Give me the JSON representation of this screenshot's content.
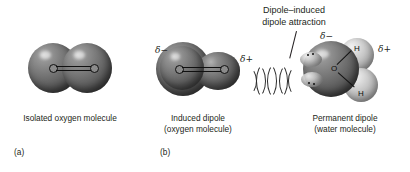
{
  "figure": {
    "background": "#ffffff",
    "callout": {
      "line1": "Dipole–induced",
      "line2": "dipole attraction"
    },
    "panels": [
      {
        "id": "(a)",
        "caption_line1": "Isolated oxygen molecule",
        "caption_line2": "",
        "molecule": "oxygen",
        "atom_labels": [
          "O",
          "O"
        ],
        "bond": "double",
        "charges": []
      },
      {
        "id": "(b)",
        "caption_line1": "Induced dipole",
        "caption_line2": "(oxygen molecule)",
        "molecule": "oxygen-distorted",
        "atom_labels": [
          "O",
          "O"
        ],
        "bond": "double",
        "charges": [
          {
            "symbol": "δ−",
            "position": "left"
          },
          {
            "symbol": "δ+",
            "position": "right"
          }
        ]
      },
      {
        "id": "",
        "caption_line1": "Permanent dipole",
        "caption_line2": "(water molecule)",
        "molecule": "water",
        "atom_labels": [
          "O",
          "H",
          "H"
        ],
        "bond": "single",
        "charges": [
          {
            "symbol": "δ−",
            "position": "top-left"
          },
          {
            "symbol": "δ+",
            "position": "top-right"
          }
        ]
      }
    ],
    "attraction_arcs": {
      "count": 8,
      "sequence": [
        ")",
        ")",
        "(",
        ")",
        "(",
        ")",
        "(",
        "("
      ],
      "color": "#2b2b2b"
    },
    "colors": {
      "oxygen_sphere": "#646464",
      "hydrogen_sphere": "#c9c9c9",
      "text": "#231f20",
      "bond": "#101010"
    }
  }
}
